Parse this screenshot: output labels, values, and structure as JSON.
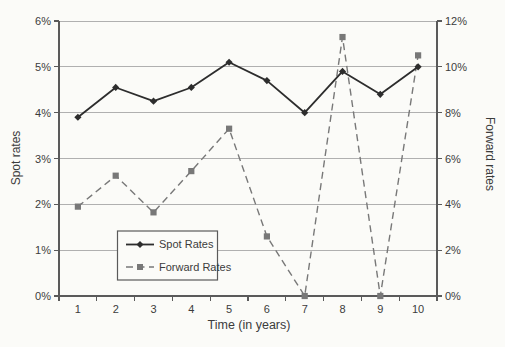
{
  "chart_data": {
    "type": "line",
    "title": "",
    "xlabel": "Time (in years)",
    "x": [
      "1",
      "2",
      "3",
      "4",
      "5",
      "6",
      "7",
      "8",
      "9",
      "10"
    ],
    "left_axis": {
      "label": "Spot rates",
      "min": 0,
      "max": 6,
      "step": 1,
      "tick_labels": [
        "0%",
        "1%",
        "2%",
        "3%",
        "4%",
        "5%",
        "6%"
      ]
    },
    "right_axis": {
      "label": "Forward rates",
      "min": 0,
      "max": 12,
      "step": 2,
      "tick_labels": [
        "0%",
        "2%",
        "4%",
        "6%",
        "8%",
        "10%",
        "12%"
      ]
    },
    "series": [
      {
        "name": "Spot Rates",
        "axis": "left",
        "line": "solid",
        "marker": "diamond",
        "color": "#2d2d2d",
        "values": [
          3.9,
          4.55,
          4.25,
          4.55,
          5.1,
          4.7,
          4.0,
          4.9,
          4.4,
          5.0
        ]
      },
      {
        "name": "Forward Rates",
        "axis": "right",
        "line": "dashed",
        "marker": "square",
        "color": "#787878",
        "values": [
          3.9,
          5.25,
          3.65,
          5.45,
          7.3,
          2.6,
          0.0,
          11.3,
          0.0,
          10.5
        ]
      }
    ],
    "legend": {
      "position": "inside-bottom-left",
      "entries": [
        "Spot Rates",
        "Forward Rates"
      ]
    },
    "grid": "horizontal",
    "colors": {
      "background": "#fbfbf8",
      "grid": "#b0b0b0",
      "axis": "#5a5a5a",
      "text": "#3c3c3c"
    }
  }
}
